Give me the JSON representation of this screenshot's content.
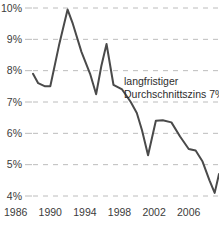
{
  "chart_data": {
    "type": "line",
    "title": "",
    "subtitle": "",
    "xlabel": "",
    "ylabel": "",
    "xlim": [
      1986,
      2007.5
    ],
    "ylim": [
      3.6,
      10.3
    ],
    "grid": true,
    "legend": "none",
    "line_color": "#4a4a4a",
    "grid_color": "#bcbcbc",
    "text_color": "#3b3b3b",
    "background_color": "#ffffff",
    "y_ticks": [
      "10%",
      "9%",
      "8%",
      "7%",
      "6%",
      "5%",
      "4%"
    ],
    "y_tick_values": [
      10,
      9,
      8,
      7,
      6,
      5,
      4
    ],
    "x_ticks": [
      "1986",
      "1990",
      "1994",
      "1998",
      "2002",
      "2006"
    ],
    "x_tick_values": [
      1986,
      1990,
      1994,
      1998,
      2002,
      2006
    ],
    "annotations": [
      {
        "name": "long-term-average-note",
        "line1": "langfristiger",
        "line2": "Durchschnittszins 7%",
        "x": 1999.2,
        "y": 7.6
      }
    ],
    "series": [
      {
        "name": "Zins",
        "color": "#4a4a4a",
        "x": [
          1986.0,
          1986.6,
          1987.4,
          1988.0,
          1989.0,
          1990.0,
          1990.6,
          1991.6,
          1992.6,
          1993.3,
          1993.9,
          1994.5,
          1995.3,
          1996.3,
          1997.3,
          1998.0,
          1998.6,
          1999.3,
          2000.2,
          2001.0,
          2002.0,
          2003.0,
          2004.0,
          2004.8,
          2005.6,
          2006.4,
          2007.0,
          2007.5
        ],
        "y": [
          7.9,
          7.6,
          7.5,
          7.5,
          8.8,
          9.95,
          9.5,
          8.6,
          7.9,
          7.25,
          8.15,
          8.85,
          7.55,
          7.4,
          7.0,
          6.65,
          6.1,
          5.3,
          6.4,
          6.42,
          6.35,
          5.9,
          5.5,
          5.45,
          5.1,
          4.5,
          4.1,
          4.7
        ]
      }
    ]
  }
}
